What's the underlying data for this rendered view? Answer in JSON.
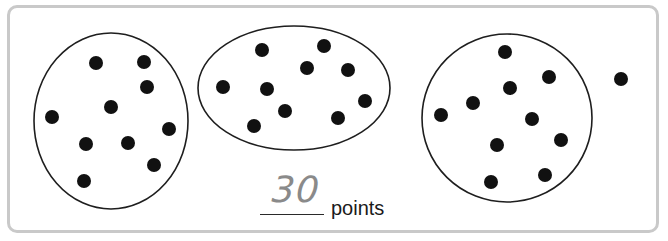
{
  "worksheet": {
    "groups": [
      {
        "label": "group-1",
        "dot_count": 10
      },
      {
        "label": "group-2",
        "dot_count": 10
      },
      {
        "label": "group-3",
        "dot_count": 10
      }
    ],
    "loose_dots": 1,
    "answer_value": "30",
    "answer_unit": "points"
  },
  "colors": {
    "frame": "#c9c9c9",
    "dot": "#111111",
    "circle_stroke": "#1e1e1e",
    "handwriting": "#8a8a8a"
  }
}
